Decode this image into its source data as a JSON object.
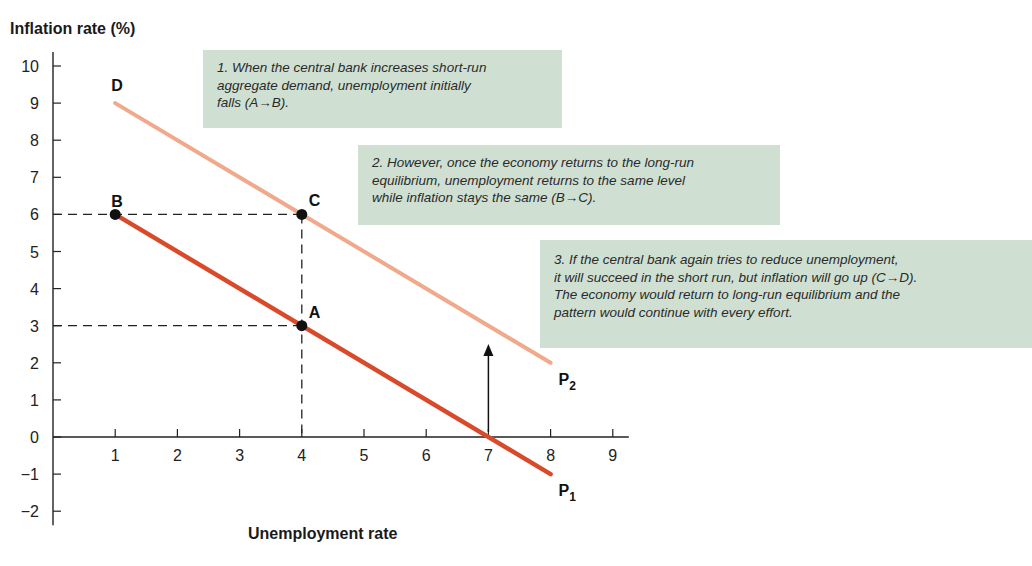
{
  "chart_data": {
    "type": "line",
    "title": "",
    "ylabel": "Inflation rate (%)",
    "xlabel": "Unemployment rate",
    "xlim": [
      0,
      9
    ],
    "ylim": [
      -2,
      10
    ],
    "x_ticks": [
      1,
      2,
      3,
      4,
      5,
      6,
      7,
      8,
      9
    ],
    "y_ticks": [
      10,
      9,
      8,
      7,
      6,
      5,
      4,
      3,
      2,
      1,
      0,
      -1,
      -2
    ],
    "y_tick_labels": [
      "10",
      "9",
      "8",
      "7",
      "6",
      "5",
      "4",
      "3",
      "2",
      "1",
      "0",
      "−1",
      "−2"
    ],
    "grid": false,
    "series": [
      {
        "name": "P1",
        "label": "P",
        "subscript": "1",
        "color": "#d94a2b",
        "points": [
          [
            1,
            6
          ],
          [
            8,
            -1
          ]
        ]
      },
      {
        "name": "P2",
        "label": "P",
        "subscript": "2",
        "color": "#f0a98a",
        "points": [
          [
            1,
            9
          ],
          [
            8,
            2
          ]
        ]
      }
    ],
    "points": [
      {
        "label": "A",
        "x": 4,
        "y": 3
      },
      {
        "label": "B",
        "x": 1,
        "y": 6
      },
      {
        "label": "C",
        "x": 4,
        "y": 6
      },
      {
        "label": "D",
        "x": 1,
        "y": 9,
        "marker": false
      }
    ],
    "guides": [
      {
        "from": [
          0,
          6
        ],
        "to": [
          4,
          6
        ],
        "style": "dashed"
      },
      {
        "from": [
          0,
          3
        ],
        "to": [
          4,
          3
        ],
        "style": "dashed"
      },
      {
        "from": [
          4,
          6
        ],
        "to": [
          4,
          0
        ],
        "style": "dashed"
      }
    ],
    "arrow": {
      "x": 7,
      "from_y": 1,
      "to_y": 2.4,
      "direction": "up"
    },
    "annotations": [
      {
        "id": 1,
        "lines": [
          "1. When the central bank increases short-run",
          "aggregate demand, unemployment initially",
          "falls  (A→B)."
        ]
      },
      {
        "id": 2,
        "lines": [
          "2. However, once the economy returns to the long-run",
          "equilibrium, unemployment returns to the same level",
          "while inflation stays the same (B→C)."
        ]
      },
      {
        "id": 3,
        "lines": [
          "3. If  the central bank again tries to reduce unemployment,",
          "it will succeed in the short run, but inflation will go up (C→D).",
          "The economy would return to long-run equilibrium and the",
          "pattern would continue with every effort."
        ]
      }
    ]
  },
  "labels": {
    "y_axis_title": "Inflation rate (%)",
    "x_axis_title": "Unemployment rate"
  },
  "notes": {
    "n1": {
      "l0": "1. When the central bank increases short-run",
      "l1": "aggregate demand, unemployment initially",
      "l2": "falls  (A→B)."
    },
    "n2": {
      "l0": "2. However, once the economy returns to the long-run",
      "l1": "equilibrium, unemployment returns to the same level",
      "l2": "while inflation stays the same (B→C)."
    },
    "n3": {
      "l0": "3. If  the central bank again tries to reduce unemployment,",
      "l1": "it will succeed in the short run, but inflation will go up (C→D).",
      "l2": "The economy would return to long-run equilibrium and the",
      "l3": "pattern would continue with every effort."
    }
  },
  "colors": {
    "p1": "#d94a2b",
    "p2": "#f0a98a",
    "note_bg": "#cfe0d2",
    "axis": "#222222"
  }
}
